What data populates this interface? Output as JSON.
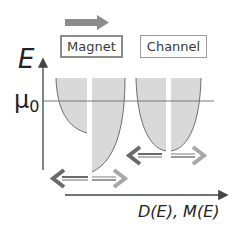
{
  "diagram": {
    "regions": [
      {
        "label": "Magnet",
        "boxed_bold": true
      },
      {
        "label": "Channel",
        "boxed_bold": false
      }
    ],
    "y_axis": {
      "label": "E"
    },
    "x_axis": {
      "label": "D(E), M(E)"
    },
    "level": {
      "symbol": "μ",
      "subscript": "0"
    },
    "current_arrow": {
      "direction": "right",
      "color": "#8c8c8c"
    },
    "colors": {
      "fill": "#d9d9d9",
      "curve": "#6e6e6e",
      "axis": "#444444",
      "dark_arrow": "#6a6a6a",
      "light_arrow": "#a8a8a8"
    }
  }
}
